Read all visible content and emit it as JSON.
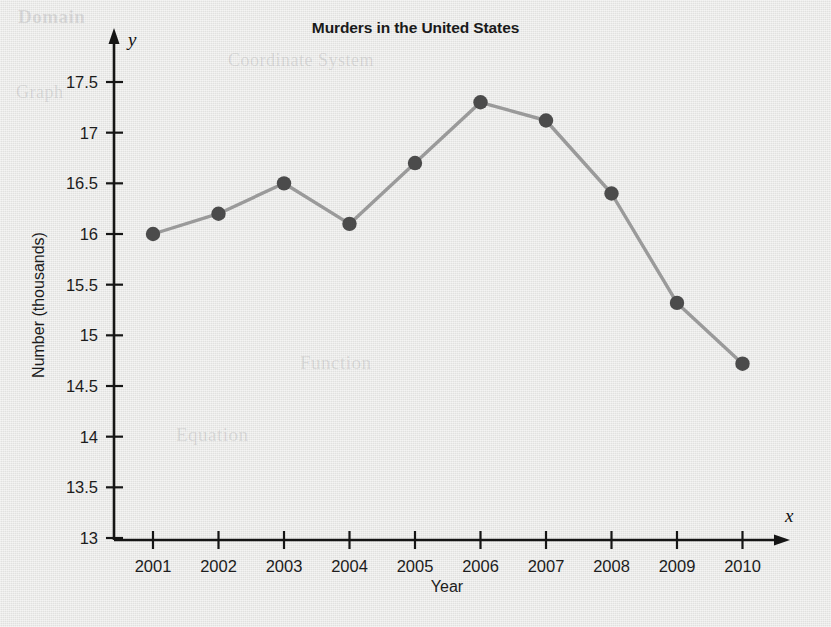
{
  "chart_data": {
    "type": "line",
    "title": "Murders in the United States",
    "xlabel": "Year",
    "ylabel": "Number (thousands)",
    "x_axis_name": "x",
    "y_axis_name": "y",
    "categories": [
      "2001",
      "2002",
      "2003",
      "2004",
      "2005",
      "2006",
      "2007",
      "2008",
      "2009",
      "2010"
    ],
    "values": [
      16.0,
      16.2,
      16.5,
      16.1,
      16.7,
      17.3,
      17.12,
      16.4,
      15.32,
      14.72
    ],
    "series": [
      {
        "name": "Murders in the United States",
        "values": [
          16.0,
          16.2,
          16.5,
          16.1,
          16.7,
          17.3,
          17.12,
          16.4,
          15.32,
          14.72
        ]
      }
    ],
    "ylim": [
      13,
      17.5
    ],
    "ytick_labels": [
      "17.5",
      "17",
      "16.5",
      "16",
      "15.5",
      "15",
      "14.5",
      "14",
      "13.5",
      "13"
    ],
    "ytick_values": [
      17.5,
      17,
      16.5,
      16,
      15.5,
      15,
      14.5,
      14,
      13.5,
      13
    ],
    "xtick_labels": [
      "2001",
      "2002",
      "2003",
      "2004",
      "2005",
      "2006",
      "2007",
      "2008",
      "2009",
      "2010"
    ],
    "grid": false,
    "legend": "none",
    "marker": "circle",
    "colors": {
      "line": "#9a9a9a",
      "marker": "#4b4b4b",
      "axis": "#151515",
      "text": "#1c1c1c",
      "background": "#e7e7e5"
    }
  },
  "ghost_text": {
    "line1": "Domain",
    "line2": "Coordinate System",
    "line3": "Graph",
    "line4": "Function",
    "line5": "Equation"
  }
}
